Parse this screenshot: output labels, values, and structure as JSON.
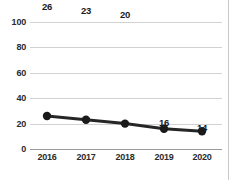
{
  "chart_data": {
    "type": "line",
    "title": "",
    "subtitle": "",
    "xlabel": "",
    "ylabel": "",
    "categories": [
      "2016",
      "2017",
      "2018",
      "2019",
      "2020"
    ],
    "values": [
      26,
      23,
      20,
      16,
      14
    ],
    "point_labels": [
      "26",
      "23",
      "20",
      "16",
      "14"
    ],
    "point_label_positions": [
      "above",
      "above",
      "above",
      "below",
      "below"
    ],
    "ylim": [
      0,
      100
    ],
    "yticks": [
      "0",
      "20",
      "40",
      "60",
      "80",
      "100"
    ],
    "ytick_values": [
      0,
      20,
      40,
      60,
      80,
      100
    ],
    "xtick_labels": [
      "2016",
      "2017",
      "2018",
      "2019",
      "2020"
    ],
    "grid": "horizontal",
    "legend": "none",
    "series": [
      {
        "name": "",
        "values": [
          26,
          23,
          20,
          16,
          14
        ]
      }
    ],
    "colors": {
      "line": "#262626",
      "marker": "#1a1a1a",
      "gridline": "#d2d2d2",
      "axis": "#9a9a9a",
      "text": "#2b2b2b",
      "background": "#ffffff",
      "page_border": "#c9c9c9"
    }
  }
}
